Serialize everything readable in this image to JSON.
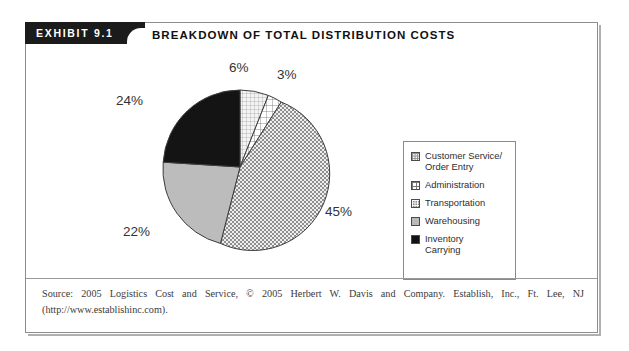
{
  "exhibit": {
    "tab_label": "EXHIBIT 9.1",
    "title": "BREAKDOWN OF TOTAL DISTRIBUTION COSTS"
  },
  "source": {
    "text": "Source: 2005 Logistics Cost and Service, © 2005 Herbert W. Davis and Company. Establish, Inc., Ft. Lee, NJ (http://www.establishinc.com)."
  },
  "legend": {
    "items": [
      {
        "label": "Customer Service/\nOrder Entry",
        "swatch": "dotted-light-swatch",
        "color": "#f2f2f2"
      },
      {
        "label": "Administration",
        "swatch": "grid-crosshatch-swatch",
        "color": "#ffffff"
      },
      {
        "label": "Transportation",
        "swatch": "checkered-gray-swatch",
        "color": "#8c8c8c"
      },
      {
        "label": "Warehousing",
        "swatch": "solid-light-gray-swatch",
        "color": "#b9b9b9"
      },
      {
        "label": "Inventory\nCarrying",
        "swatch": "solid-black-swatch",
        "color": "#121212"
      }
    ]
  },
  "pie_labels": [
    {
      "name": "label-customer-service",
      "text": "6%",
      "x": 203,
      "y": 15
    },
    {
      "name": "label-administration",
      "text": "3%",
      "x": 251,
      "y": 22
    },
    {
      "name": "label-transportation",
      "text": "45%",
      "x": 299,
      "y": 159
    },
    {
      "name": "label-warehousing",
      "text": "22%",
      "x": 97,
      "y": 179
    },
    {
      "name": "label-inventory",
      "text": "24%",
      "x": 90,
      "y": 48
    }
  ],
  "chart_data": {
    "type": "pie",
    "title": "BREAKDOWN OF TOTAL DISTRIBUTION COSTS",
    "categories": [
      "Customer Service/Order Entry",
      "Administration",
      "Transportation",
      "Warehousing",
      "Inventory Carrying"
    ],
    "values": [
      6,
      3,
      45,
      22,
      24
    ],
    "value_labels": [
      "6%",
      "3%",
      "45%",
      "22%",
      "24%"
    ],
    "units": "percent",
    "total": 100,
    "start_angle_deg": 0,
    "direction": "clockwise",
    "legend_position": "right",
    "grid": false,
    "slice_styles": [
      {
        "category": "Customer Service/Order Entry",
        "fill": "#f2f2f2",
        "pattern": "fine-dot-grid"
      },
      {
        "category": "Administration",
        "fill": "#ffffff",
        "pattern": "coarse-crosshatch"
      },
      {
        "category": "Transportation",
        "fill": "#8c8c8c",
        "pattern": "white-dot-checker"
      },
      {
        "category": "Warehousing",
        "fill": "#b9b9b9",
        "pattern": "solid"
      },
      {
        "category": "Inventory Carrying",
        "fill": "#121212",
        "pattern": "solid"
      }
    ],
    "source": "2005 Logistics Cost and Service, © 2005 Herbert W. Davis and Company. Establish, Inc., Ft. Lee, NJ (http://www.establishinc.com)."
  }
}
